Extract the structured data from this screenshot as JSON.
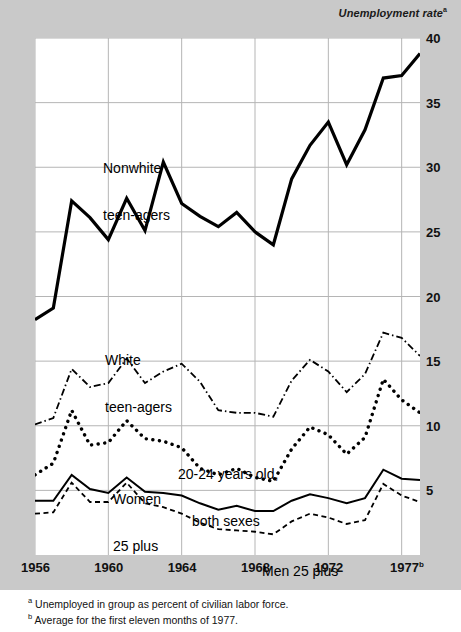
{
  "axis_title": {
    "text": "Unemployment rate",
    "marker": "a"
  },
  "footnotes": [
    {
      "marker": "a",
      "text": "Unemployed in group as percent of civilian labor force."
    },
    {
      "marker": "b",
      "text": "Average for the first eleven months of 1977."
    }
  ],
  "y_ticks": [
    "40",
    "35",
    "30",
    "25",
    "20",
    "15",
    "10",
    "5"
  ],
  "x_ticks": [
    {
      "label": "1956",
      "marker": ""
    },
    {
      "label": "1960",
      "marker": ""
    },
    {
      "label": "1964",
      "marker": ""
    },
    {
      "label": "1968",
      "marker": ""
    },
    {
      "label": "1972",
      "marker": ""
    },
    {
      "label": "1977",
      "marker": "b"
    }
  ],
  "series_labels": [
    {
      "name": "nonwhite-teenagers",
      "line1": "Nonwhite",
      "line2": "teen-agers"
    },
    {
      "name": "white-teenagers",
      "line1": "White",
      "line2": "teen-agers"
    },
    {
      "name": "twenty-to-24",
      "line1": "20-24 years old,",
      "line2": "both sexes"
    },
    {
      "name": "women-25-plus",
      "line1": "Women",
      "line2": "25 plus"
    },
    {
      "name": "men-25-plus",
      "line1": "Men 25 plus",
      "line2": ""
    }
  ],
  "colors": {
    "page_background": "#c9c9c9",
    "plot_background": "#ffffff",
    "gridline": "#b5b5b5",
    "line": "#000000",
    "text": "#111111"
  },
  "chart_data": {
    "type": "line",
    "title": "Unemployment rate",
    "xlabel": "",
    "ylabel": "Unemployment rate",
    "ylim": [
      0,
      40
    ],
    "xlim": [
      1956,
      1977
    ],
    "grid": true,
    "legend": "inline-labels",
    "y_tick_values": [
      5,
      10,
      15,
      20,
      25,
      30,
      35,
      40
    ],
    "x_tick_values": [
      1956,
      1960,
      1964,
      1968,
      1972,
      1977
    ],
    "x": [
      1956,
      1957,
      1958,
      1959,
      1960,
      1961,
      1962,
      1963,
      1964,
      1965,
      1966,
      1967,
      1968,
      1969,
      1970,
      1971,
      1972,
      1973,
      1974,
      1975,
      1976,
      1977
    ],
    "series": [
      {
        "name": "Nonwhite teen-agers",
        "style": "solid",
        "values": [
          18.2,
          19.1,
          27.4,
          26.1,
          24.4,
          27.6,
          25.1,
          30.4,
          27.2,
          26.2,
          25.4,
          26.5,
          25.0,
          24.0,
          29.1,
          31.7,
          33.5,
          30.2,
          32.9,
          36.9,
          37.1,
          38.8
        ]
      },
      {
        "name": "White teen-agers",
        "style": "dashdot",
        "values": [
          10.1,
          10.6,
          14.4,
          13.0,
          13.3,
          15.2,
          13.3,
          14.2,
          14.8,
          13.4,
          11.2,
          11.0,
          11.0,
          10.7,
          13.5,
          15.1,
          14.2,
          12.6,
          14.0,
          17.2,
          16.8,
          15.4
        ]
      },
      {
        "name": "20-24 years old, both sexes",
        "style": "dotted",
        "values": [
          6.2,
          7.1,
          11.2,
          8.5,
          8.7,
          10.4,
          9.0,
          8.8,
          8.3,
          6.7,
          6.2,
          6.7,
          6.0,
          5.7,
          8.2,
          9.9,
          9.3,
          7.8,
          9.1,
          13.6,
          12.0,
          11.0
        ]
      },
      {
        "name": "Women 25 plus",
        "style": "solid-thin",
        "values": [
          4.2,
          4.2,
          6.2,
          5.1,
          4.8,
          6.0,
          4.9,
          4.8,
          4.6,
          4.0,
          3.5,
          3.8,
          3.4,
          3.4,
          4.2,
          4.7,
          4.4,
          4.0,
          4.4,
          6.6,
          5.9,
          5.8
        ]
      },
      {
        "name": "Men 25 plus",
        "style": "dashed",
        "values": [
          3.2,
          3.3,
          5.6,
          4.1,
          4.1,
          5.6,
          4.0,
          3.7,
          3.2,
          2.5,
          2.0,
          1.9,
          1.8,
          1.6,
          2.6,
          3.2,
          2.9,
          2.4,
          2.7,
          5.5,
          4.6,
          4.1
        ]
      }
    ]
  }
}
